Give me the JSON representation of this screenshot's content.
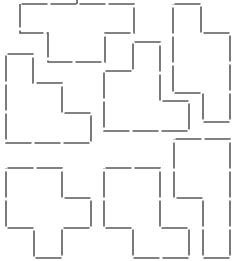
{
  "diagram": {
    "title": "",
    "grid_cell_px": 29,
    "stroke_color": "#5a5a5a",
    "background": "#ffffff",
    "pieces": [
      {
        "id": "t-piece-top",
        "points": "20,4 134,4 134,33 105,33 105,62 48,62 48,33 20,33"
      },
      {
        "id": "staircase-left",
        "points": "6,54 33,54 33,83 62,83 62,113 91,113 91,143 6,143"
      },
      {
        "id": "column-right-top",
        "points": "173,4 201,4 201,33 230,33 230,122 203,122 203,93 173,93"
      },
      {
        "id": "l-piece-middle",
        "points": "133,42 160,42 160,101 189,101 189,131 104,131 104,71 133,71"
      },
      {
        "id": "cross-bottom-left",
        "points": "6,168 62,168 62,198 91,198 91,228 62,228 62,258 34,258 34,228 6,228"
      },
      {
        "id": "piece-bottom-middle",
        "points": "104,168 160,168 160,228 189,228 189,258 133,258 133,228 104,228"
      },
      {
        "id": "piece-bottom-right",
        "points": "174,139 230,139 230,258 203,258 203,198 174,198"
      }
    ],
    "marker": {
      "x1": 77,
      "y1": 0,
      "x2": 77,
      "y2": 4
    }
  }
}
